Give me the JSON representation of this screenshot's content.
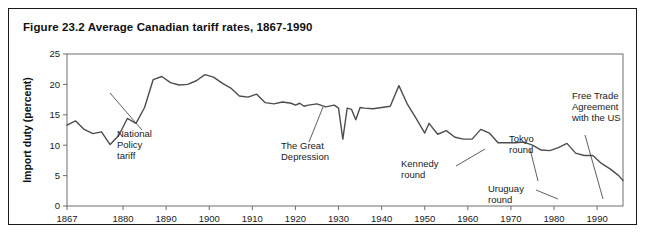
{
  "figure": {
    "title": "Figure 23.2 Average Canadian tariff rates, 1867-1990",
    "border_color": "#1a1a1a",
    "background": "#ffffff"
  },
  "chart_data": {
    "type": "line",
    "title": "Figure 23.2 Average Canadian tariff rates, 1867-1990",
    "xlabel": "",
    "ylabel": "Import duty (percent)",
    "ylim": [
      0,
      25
    ],
    "xlim": [
      1867,
      1996
    ],
    "grid": false,
    "legend": null,
    "line_color": "#4d4d4d",
    "axis_color": "#6e6e6e",
    "yticks": [
      0,
      5,
      10,
      15,
      20,
      25
    ],
    "xticks": [
      1867,
      1880,
      1890,
      1900,
      1910,
      1920,
      1930,
      1940,
      1950,
      1960,
      1970,
      1980,
      1990
    ],
    "series": [
      {
        "name": "Average Canadian tariff rate",
        "x": [
          1867,
          1869,
          1871,
          1873,
          1875,
          1877,
          1879,
          1881,
          1883,
          1885,
          1887,
          1889,
          1891,
          1893,
          1895,
          1897,
          1899,
          1901,
          1903,
          1905,
          1907,
          1909,
          1911,
          1913,
          1915,
          1917,
          1919,
          1920,
          1921,
          1922,
          1923,
          1925,
          1927,
          1929,
          1930,
          1931,
          1932,
          1933,
          1934,
          1935,
          1936,
          1938,
          1940,
          1942,
          1944,
          1946,
          1948,
          1950,
          1951,
          1953,
          1955,
          1957,
          1959,
          1961,
          1963,
          1965,
          1967,
          1969,
          1971,
          1973,
          1975,
          1977,
          1979,
          1981,
          1983,
          1985,
          1987,
          1989,
          1991,
          1993,
          1995,
          1996
        ],
        "y": [
          13.3,
          14.0,
          12.6,
          11.9,
          12.2,
          10.1,
          11.6,
          14.4,
          13.6,
          16.2,
          20.8,
          21.3,
          20.3,
          19.9,
          20.0,
          20.6,
          21.6,
          21.2,
          20.2,
          19.4,
          18.1,
          17.9,
          18.4,
          17.0,
          16.8,
          17.1,
          16.9,
          16.6,
          16.9,
          16.4,
          16.6,
          16.8,
          16.3,
          16.6,
          16.1,
          11.0,
          16.1,
          15.9,
          14.2,
          16.2,
          16.1,
          16.0,
          16.2,
          16.4,
          19.8,
          16.7,
          14.4,
          12.0,
          13.6,
          11.8,
          12.4,
          11.3,
          11.0,
          11.0,
          12.6,
          12.0,
          10.4,
          10.4,
          10.4,
          10.5,
          10.0,
          9.2,
          9.1,
          9.6,
          10.3,
          8.7,
          8.3,
          8.3,
          7.0,
          6.1,
          5.0,
          4.2
        ],
        "peak_national_policy": 21.6,
        "peak_great_depression": 19.8,
        "value_1867": 13.3,
        "value_final": 2.6
      }
    ],
    "annotations": [
      {
        "id": "national-policy",
        "lines": [
          "National",
          "Policy",
          "tariff"
        ],
        "target_year": 1881,
        "target_value": 15.0
      },
      {
        "id": "great-depression",
        "lines": [
          "The Great",
          "Depression"
        ],
        "target_year": 1932,
        "target_value": 16.5
      },
      {
        "id": "kennedy-round",
        "lines": [
          "Kennedy",
          "round"
        ],
        "target_year": 1969,
        "target_value": 10.4
      },
      {
        "id": "tokyo-round",
        "lines": [
          "Tokyo",
          "round"
        ],
        "target_year": 1981,
        "target_value": 8.0
      },
      {
        "id": "uruguay-round",
        "lines": [
          "Uruguay",
          "round"
        ],
        "target_year": 1990,
        "target_value": 5.5
      },
      {
        "id": "free-trade-agreement",
        "lines": [
          "Free Trade",
          "Agreement",
          "with the US"
        ],
        "target_year": 1989,
        "target_value": 5.0
      }
    ]
  }
}
